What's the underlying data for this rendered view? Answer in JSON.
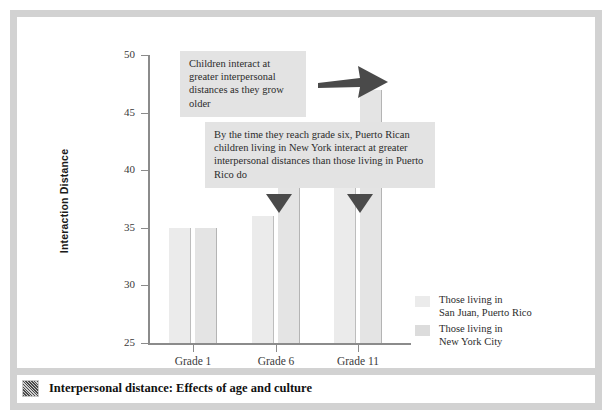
{
  "chart_data": {
    "type": "bar",
    "title": "",
    "xlabel": "",
    "ylabel": "Interaction Distance",
    "categories": [
      "Grade 1",
      "Grade 6",
      "Grade 11"
    ],
    "series": [
      {
        "name": "Those living in\nSan Juan, Puerto Rico",
        "values": [
          35,
          36,
          43
        ],
        "color": "#ebebeb"
      },
      {
        "name": "Those living in\nNew York City",
        "values": [
          35,
          38.5,
          47
        ],
        "color": "#dcdcdc"
      }
    ],
    "ylim": [
      25,
      50
    ],
    "yticks": [
      25,
      30,
      35,
      40,
      45,
      50
    ],
    "grid": false,
    "legend_position": "right",
    "annotations": [
      "Children interact at greater interpersonal distances as they grow older",
      "By the time they reach grade six, Puerto Rican children living in New York interact at greater interpersonal distances than those living in Puerto Rico do"
    ]
  },
  "axes": {
    "y_title": "Interaction Distance",
    "y_ticks": [
      "50",
      "45",
      "40",
      "35",
      "30",
      "25"
    ],
    "x_ticks": [
      "Grade 1",
      "Grade 6",
      "Grade 11"
    ]
  },
  "callouts": {
    "first": "Children interact at greater interpersonal distances as they grow older",
    "second": "By the time they reach grade six, Puerto Rican children living in New York interact at greater interpersonal distances than those living in Puerto Rico do"
  },
  "legend": {
    "items": [
      {
        "label": "Those living in\nSan Juan, Puerto Rico",
        "color": "#ebebeb"
      },
      {
        "label": "Those living in\nNew York City",
        "color": "#dcdcdc"
      }
    ]
  },
  "caption": {
    "text": "Interpersonal distance: Effects of age and culture",
    "icon": "textured-thumbnail-icon"
  },
  "colors": {
    "frame": "#d2d2d2",
    "axis": "#8b8b8b",
    "callout_bg": "#e3e3e3",
    "pointer": "#4a4a4a",
    "bar_series_a": "#ebebeb",
    "bar_series_b": "#dcdcdc"
  }
}
